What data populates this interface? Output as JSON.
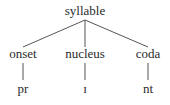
{
  "tree": {
    "root": {
      "label": "syllable"
    },
    "children": [
      {
        "label": "onset",
        "leaf": "pr"
      },
      {
        "label": "nucleus",
        "leaf": "ɪ"
      },
      {
        "label": "coda",
        "leaf": "nt"
      }
    ]
  },
  "colors": {
    "line": "#555555",
    "text": "#2a2a2a"
  }
}
